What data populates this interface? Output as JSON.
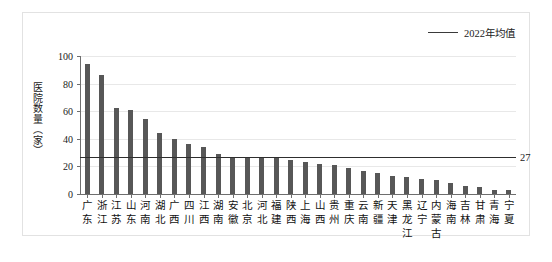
{
  "legend": {
    "label": "2022年均值",
    "icon": "horizontal-line-icon"
  },
  "axes": {
    "ylabel": "医院数量（家）",
    "yticks": [
      0,
      20,
      40,
      60,
      80,
      100
    ],
    "ylim": [
      0,
      100
    ],
    "xlabel": ""
  },
  "average": {
    "value": 27,
    "value_label": "27"
  },
  "chart_data": {
    "type": "bar",
    "title": "",
    "xlabel": "",
    "ylabel": "医院数量（家）",
    "ylim": [
      0,
      100
    ],
    "yticks": [
      0,
      20,
      40,
      60,
      80,
      100
    ],
    "grid": true,
    "legend_position": "top-right",
    "series": [
      {
        "name": "医院数量（家）",
        "color": "#575757",
        "values": [
          94,
          86,
          62,
          61,
          54,
          44,
          40,
          36,
          34,
          29,
          27,
          27,
          27,
          26,
          25,
          23,
          22,
          21,
          19,
          17,
          15,
          13,
          12,
          11,
          10,
          8,
          6,
          5,
          3,
          3
        ]
      }
    ],
    "categories": [
      "广东",
      "浙江",
      "江苏",
      "山东",
      "河南",
      "湖北",
      "广西",
      "四川",
      "江西",
      "湖南",
      "安徽",
      "北京",
      "河北",
      "福建",
      "陕西",
      "上海",
      "山西",
      "贵州",
      "重庆",
      "云南",
      "新疆",
      "天津",
      "黑龙江",
      "辽宁",
      "内蒙古",
      "海南",
      "吉林",
      "甘肃",
      "青海",
      "宁夏"
    ],
    "annotations": [
      {
        "name": "average-line",
        "label": "2022年均值",
        "value": 27,
        "value_label": "27",
        "orientation": "horizontal",
        "color": "#2e2e2e"
      }
    ]
  }
}
